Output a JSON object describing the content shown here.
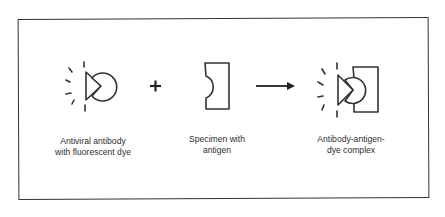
{
  "diagram": {
    "type": "reaction-schematic",
    "colors": {
      "stroke": "#333333",
      "background": "#ffffff",
      "text": "#2e2e2e"
    },
    "elements": [
      {
        "id": "antibody",
        "icon": "antibody-with-dye-icon",
        "label_line1": "Antiviral antibody",
        "label_line2": "with fluorescent dye"
      },
      {
        "id": "operator-plus",
        "icon": "plus-icon",
        "symbol": "+"
      },
      {
        "id": "specimen",
        "icon": "specimen-antigen-icon",
        "label_line1": "Specimen with",
        "label_line2": "antigen"
      },
      {
        "id": "operator-arrow",
        "icon": "arrow-right-icon"
      },
      {
        "id": "complex",
        "icon": "antibody-antigen-complex-icon",
        "label_line1": "Antibody-antigen-",
        "label_line2": "dye complex"
      }
    ]
  }
}
